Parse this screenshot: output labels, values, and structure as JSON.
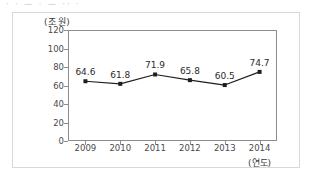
{
  "artifact": {
    "top_strip_text": "· · — · — ·· ·"
  },
  "chart_data": {
    "type": "line",
    "title": "",
    "xlabel": "(연도)",
    "ylabel": "(조 원)",
    "categories": [
      "2009",
      "2010",
      "2011",
      "2012",
      "2013",
      "2014"
    ],
    "values": [
      64.6,
      61.8,
      71.9,
      65.8,
      60.5,
      74.7
    ],
    "value_labels": [
      "64.6",
      "61.8",
      "71.9",
      "65.8",
      "60.5",
      "74.7"
    ],
    "yticks": [
      0,
      20,
      40,
      60,
      80,
      100,
      120
    ],
    "ytick_labels": [
      "0",
      "20",
      "40",
      "60",
      "80",
      "100",
      "120"
    ],
    "ylim": [
      0,
      120
    ],
    "grid": false,
    "legend": null,
    "series": [
      {
        "name": "",
        "values": [
          64.6,
          61.8,
          71.9,
          65.8,
          60.5,
          74.7
        ],
        "line_color": "#1f1f1f",
        "marker": "square",
        "marker_color": "#1f1f1f"
      }
    ],
    "colors": {
      "line": "#1f1f1f",
      "marker": "#1f1f1f",
      "axis": "#8d8d8d",
      "tick_text": "#4a4a4a",
      "label_text": "#2b2b2b",
      "outer_frame": "#d8d8d8",
      "background": "#ffffff"
    }
  }
}
